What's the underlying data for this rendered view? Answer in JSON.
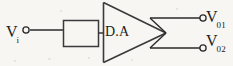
{
  "figure": {
    "background_color": "#f7f6f3",
    "ink_color": "#1d1d1d",
    "width": 233,
    "height": 66
  },
  "amplifier": {
    "label": "D.A",
    "shape": "triangle",
    "meaning": "differential amplifier"
  },
  "input_block": {
    "shape": "rectangle",
    "label": ""
  },
  "input": {
    "symbol": "V",
    "subscript": "i",
    "terminal": "open-circle"
  },
  "outputs": [
    {
      "symbol": "V",
      "subscript": "01",
      "terminal": "open-circle"
    },
    {
      "symbol": "V",
      "subscript": "02",
      "terminal": "open-circle"
    }
  ]
}
